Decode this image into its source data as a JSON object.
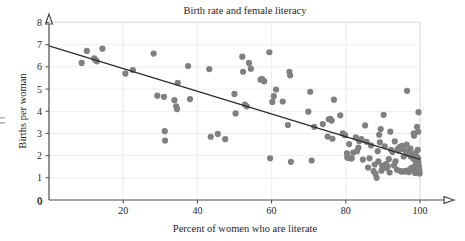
{
  "chart_data": {
    "type": "scatter",
    "title": "Birth rate and female literacy",
    "xlabel": "Percent of women who are literate",
    "ylabel": "Births per woman",
    "xlim": [
      0,
      100
    ],
    "ylim": [
      0,
      8
    ],
    "xticks": [
      0,
      20,
      40,
      60,
      80,
      100
    ],
    "yticks": [
      0,
      1,
      2,
      3,
      4,
      5,
      6,
      7,
      8
    ],
    "xtick_labels": [
      "0",
      "20",
      "40",
      "60",
      "80",
      "100"
    ],
    "ytick_labels": [
      "0",
      "1",
      "2",
      "3",
      "4",
      "5",
      "6",
      "7",
      "8"
    ],
    "grid": true,
    "legend": "none",
    "marker_color": "#808080",
    "marker_size": 3.1,
    "trend_line": {
      "label": "least-squares regression line",
      "color": "#2b2b2b",
      "x_start": 0,
      "y_start": 6.95,
      "x_end": 100,
      "y_end": 1.83
    },
    "points": [
      [
        8.8,
        6.18
      ],
      [
        10.2,
        6.72
      ],
      [
        12.2,
        6.38
      ],
      [
        12.6,
        6.3
      ],
      [
        12.9,
        6.25
      ],
      [
        14.4,
        6.82
      ],
      [
        20.6,
        5.7
      ],
      [
        22.6,
        5.86
      ],
      [
        28.2,
        6.6
      ],
      [
        29.2,
        4.7
      ],
      [
        31.0,
        4.65
      ],
      [
        31.2,
        3.1
      ],
      [
        31.3,
        2.68
      ],
      [
        33.8,
        4.5
      ],
      [
        34.3,
        4.22
      ],
      [
        34.5,
        4.1
      ],
      [
        34.7,
        5.28
      ],
      [
        37.5,
        6.04
      ],
      [
        38.0,
        4.55
      ],
      [
        43.2,
        5.9
      ],
      [
        43.6,
        2.85
      ],
      [
        45.5,
        2.98
      ],
      [
        47.5,
        2.74
      ],
      [
        50.0,
        4.78
      ],
      [
        50.3,
        3.9
      ],
      [
        52.1,
        6.46
      ],
      [
        52.3,
        5.78
      ],
      [
        52.8,
        4.3
      ],
      [
        53.3,
        4.22
      ],
      [
        53.9,
        6.18
      ],
      [
        54.4,
        5.92
      ],
      [
        57.0,
        5.42
      ],
      [
        57.4,
        5.46
      ],
      [
        57.8,
        5.38
      ],
      [
        58.0,
        5.35
      ],
      [
        59.4,
        6.66
      ],
      [
        59.6,
        1.88
      ],
      [
        60.2,
        4.42
      ],
      [
        60.6,
        4.68
      ],
      [
        61.2,
        4.98
      ],
      [
        63.0,
        4.44
      ],
      [
        64.4,
        3.38
      ],
      [
        64.8,
        5.78
      ],
      [
        65.0,
        5.62
      ],
      [
        65.2,
        1.72
      ],
      [
        69.9,
        3.98
      ],
      [
        70.4,
        4.88
      ],
      [
        70.8,
        1.78
      ],
      [
        71.5,
        3.3
      ],
      [
        73.8,
        3.42
      ],
      [
        75.1,
        2.86
      ],
      [
        75.4,
        3.64
      ],
      [
        75.8,
        3.66
      ],
      [
        76.2,
        3.58
      ],
      [
        76.4,
        2.76
      ],
      [
        76.8,
        4.52
      ],
      [
        78.5,
        3.82
      ],
      [
        79.2,
        3.0
      ],
      [
        79.8,
        2.92
      ],
      [
        80.3,
        2.1
      ],
      [
        80.4,
        1.92
      ],
      [
        80.6,
        1.9
      ],
      [
        80.9,
        2.52
      ],
      [
        81.3,
        1.88
      ],
      [
        81.6,
        1.88
      ],
      [
        82.0,
        2.14
      ],
      [
        82.7,
        2.82
      ],
      [
        83.0,
        2.2
      ],
      [
        83.4,
        2.36
      ],
      [
        83.6,
        2.66
      ],
      [
        84.2,
        2.74
      ],
      [
        84.6,
        1.82
      ],
      [
        85.2,
        3.36
      ],
      [
        85.6,
        2.62
      ],
      [
        86.0,
        1.46
      ],
      [
        86.4,
        1.88
      ],
      [
        86.8,
        2.46
      ],
      [
        87.5,
        1.3
      ],
      [
        87.8,
        1.6
      ],
      [
        88.0,
        1.18
      ],
      [
        88.3,
        1.0
      ],
      [
        88.6,
        2.2
      ],
      [
        88.8,
        1.74
      ],
      [
        89.0,
        2.94
      ],
      [
        89.4,
        3.2
      ],
      [
        89.6,
        1.32
      ],
      [
        89.8,
        1.54
      ],
      [
        90.2,
        3.84
      ],
      [
        90.5,
        2.42
      ],
      [
        90.8,
        1.62
      ],
      [
        91.0,
        1.44
      ],
      [
        91.3,
        1.52
      ],
      [
        91.6,
        1.84
      ],
      [
        92.0,
        3.08
      ],
      [
        92.2,
        2.26
      ],
      [
        92.6,
        2.16
      ],
      [
        93.0,
        1.56
      ],
      [
        93.4,
        1.74
      ],
      [
        93.8,
        1.36
      ],
      [
        94.0,
        2.3
      ],
      [
        94.3,
        2.22
      ],
      [
        94.6,
        2.4
      ],
      [
        94.8,
        1.3
      ],
      [
        95.0,
        1.28
      ],
      [
        95.2,
        2.44
      ],
      [
        95.4,
        2.3
      ],
      [
        95.6,
        1.96
      ],
      [
        95.8,
        1.28
      ],
      [
        96.0,
        1.3
      ],
      [
        96.2,
        2.2
      ],
      [
        96.4,
        2.5
      ],
      [
        96.5,
        4.92
      ],
      [
        96.6,
        2.08
      ],
      [
        96.8,
        1.34
      ],
      [
        97.0,
        1.26
      ],
      [
        97.2,
        2.14
      ],
      [
        97.4,
        2.32
      ],
      [
        97.5,
        1.96
      ],
      [
        97.6,
        1.44
      ],
      [
        97.8,
        1.32
      ],
      [
        98.0,
        2.04
      ],
      [
        98.2,
        1.86
      ],
      [
        98.3,
        3.0
      ],
      [
        98.4,
        2.9
      ],
      [
        98.5,
        1.52
      ],
      [
        98.6,
        1.36
      ],
      [
        98.7,
        1.22
      ],
      [
        98.8,
        2.12
      ],
      [
        98.9,
        1.72
      ],
      [
        99.0,
        1.96
      ],
      [
        99.1,
        1.6
      ],
      [
        99.2,
        1.42
      ],
      [
        99.3,
        1.3
      ],
      [
        99.4,
        2.26
      ],
      [
        99.5,
        1.88
      ],
      [
        99.6,
        1.68
      ],
      [
        99.7,
        1.5
      ],
      [
        99.8,
        1.34
      ],
      [
        99.9,
        1.2
      ],
      [
        99.5,
        3.08
      ],
      [
        99.2,
        3.3
      ],
      [
        99.6,
        3.96
      ],
      [
        89.2,
        2.6
      ],
      [
        91.8,
        1.24
      ],
      [
        93.2,
        2.64
      ]
    ]
  }
}
